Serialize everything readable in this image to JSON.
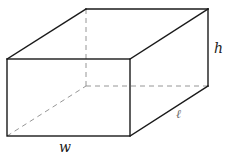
{
  "figure": {
    "type": "rectangular-prism",
    "labels": {
      "width": "w",
      "length": "ℓ",
      "height": "h"
    },
    "colors": {
      "visible_edge": "#1a1a1a",
      "hidden_edge": "#8a8a8a",
      "background": "#ffffff"
    }
  }
}
